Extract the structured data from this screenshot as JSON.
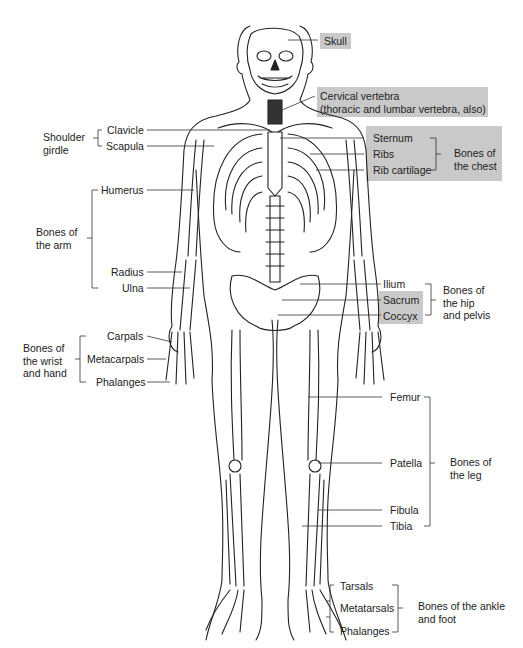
{
  "figure": {
    "box_color": "#c9c9c9",
    "line_color": "#222222"
  },
  "labels": {
    "skull": "Skull",
    "cervical_1": "Cervical vertebra",
    "cervical_2": "(thoracic and lumbar vertebra, also)",
    "clavicle": "Clavicle",
    "scapula": "Scapula",
    "sternum": "Sternum",
    "ribs": "Ribs",
    "rib_cartilage": "Rib cartilage",
    "humerus": "Humerus",
    "radius": "Radius",
    "ulna": "Ulna",
    "ilium": "Ilium",
    "sacrum": "Sacrum",
    "coccyx": "Coccyx",
    "carpals": "Carpals",
    "metacarpals": "Metacarpals",
    "phalanges_hand": "Phalanges",
    "femur": "Femur",
    "patella": "Patella",
    "fibula": "Fibula",
    "tibia": "Tibia",
    "tarsals": "Tarsals",
    "metatarsals": "Metatarsals",
    "phalanges_foot": "Phalanges"
  },
  "groups": {
    "shoulder_1": "Shoulder",
    "shoulder_2": "girdle",
    "chest_1": "Bones of",
    "chest_2": "the chest",
    "arm_1": "Bones of",
    "arm_2": "the arm",
    "hip_1": "Bones of",
    "hip_2": "the hip",
    "hip_3": "and pelvis",
    "wrist_1": "Bones of",
    "wrist_2": "the wrist",
    "wrist_3": "and hand",
    "leg_1": "Bones of",
    "leg_2": "the leg",
    "foot_1": "Bones of the ankle",
    "foot_2": "and foot"
  }
}
